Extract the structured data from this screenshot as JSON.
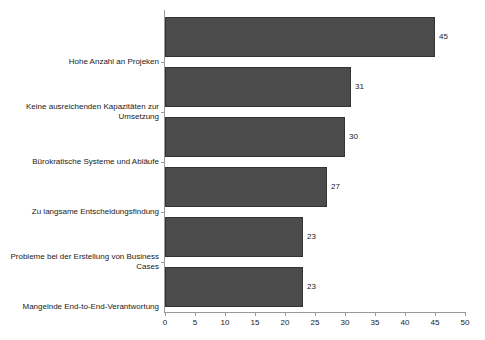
{
  "chart_data": {
    "type": "bar",
    "orientation": "horizontal",
    "title": "",
    "subtitle": "",
    "xlabel": "",
    "ylabel": "",
    "xlim": [
      0,
      50
    ],
    "xticks": [
      0,
      5,
      10,
      15,
      20,
      25,
      30,
      35,
      40,
      45,
      50
    ],
    "grid": false,
    "legend": false,
    "bar_color": "#4b4b4b",
    "bar_border_color": "#333333",
    "axis_color": "#9a9a9a",
    "categories": [
      "Hohe Anzahl an Projeken",
      "Keine ausreichenden Kapazitäten zur Umsetzung",
      "Bürokratische Systeme und Abläufe",
      "Zu langsame Entscheidungsfindung",
      "Probleme bei der Erstellung von Business Cases",
      "Mangelnde End-to-End-Verantwortung"
    ],
    "values": [
      45,
      31,
      30,
      27,
      23,
      23
    ],
    "value_labels": [
      "45",
      "31",
      "30",
      "27",
      "23",
      "23"
    ],
    "xtick_labels": [
      "0",
      "5",
      "10",
      "15",
      "20",
      "25",
      "30",
      "35",
      "40",
      "45",
      "50"
    ]
  }
}
